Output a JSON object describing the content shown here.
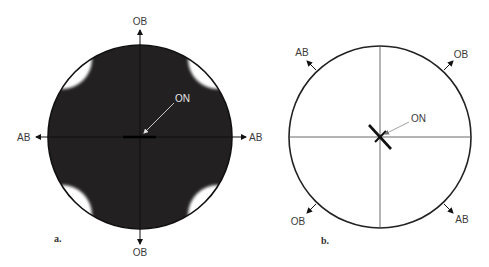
{
  "figure_a": {
    "panel_label": "a.",
    "labels": {
      "top": "OB",
      "bottom": "OB",
      "left": "AB",
      "right": "AB",
      "center": "ON"
    },
    "colors": {
      "fill": "#222020",
      "window": "#ffffff",
      "outline": "#111111",
      "pointer": "#d8d8d8"
    }
  },
  "figure_b": {
    "panel_label": "b.",
    "labels": {
      "upper_left": "AB",
      "upper_right": "OB",
      "lower_left": "OB",
      "lower_right": "AB",
      "center": "ON"
    },
    "colors": {
      "fill": "#ffffff",
      "outline": "#222222",
      "crosshair": "#444444",
      "pointer": "#888888"
    }
  }
}
